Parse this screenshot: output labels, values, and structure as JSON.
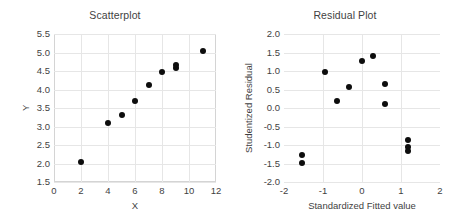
{
  "figure": {
    "background_color": "#ffffff",
    "grid_color": "#e6e6e6",
    "frame_color": "#d4d4d4",
    "marker_color": "#0d0d0d",
    "text_color": "#3f3f3f"
  },
  "chart_data": [
    {
      "type": "scatter",
      "title": "Scatterplot",
      "xlabel": "X",
      "ylabel": "Y",
      "xlim": [
        0,
        12
      ],
      "ylim": [
        1.5,
        5.5
      ],
      "xticks": [
        "0",
        "2",
        "4",
        "6",
        "8",
        "10",
        "12"
      ],
      "xtick_values": [
        0,
        2,
        4,
        6,
        8,
        10,
        12
      ],
      "yticks": [
        "1.5",
        "2.0",
        "2.5",
        "3.0",
        "3.5",
        "4.0",
        "4.5",
        "5.0",
        "5.5"
      ],
      "ytick_values": [
        1.5,
        2.0,
        2.5,
        3.0,
        3.5,
        4.0,
        4.5,
        5.0,
        5.5
      ],
      "grid": true,
      "legend": false,
      "points": [
        {
          "x": 2,
          "y": 2.05
        },
        {
          "x": 4,
          "y": 3.1
        },
        {
          "x": 5,
          "y": 3.3
        },
        {
          "x": 6,
          "y": 3.68
        },
        {
          "x": 7,
          "y": 4.13
        },
        {
          "x": 8,
          "y": 4.48
        },
        {
          "x": 9,
          "y": 4.58
        },
        {
          "x": 9,
          "y": 4.67
        },
        {
          "x": 11,
          "y": 5.05
        }
      ]
    },
    {
      "type": "scatter",
      "title": "Residual Plot",
      "xlabel": "Standardized Fitted value",
      "ylabel": "Studentized Residual",
      "xlim": [
        -2,
        2
      ],
      "ylim": [
        -2.0,
        2.0
      ],
      "xticks": [
        "-2",
        "-1",
        "0",
        "1",
        "2"
      ],
      "xtick_values": [
        -2,
        -1,
        0,
        1,
        2
      ],
      "yticks": [
        "-2.0",
        "-1.5",
        "-1.0",
        "-0.5",
        "0.0",
        "0.5",
        "1.0",
        "1.5",
        "2.0"
      ],
      "ytick_values": [
        -2.0,
        -1.5,
        -1.0,
        -0.5,
        0.0,
        0.5,
        1.0,
        1.5,
        2.0
      ],
      "grid": true,
      "legend": false,
      "points": [
        {
          "x": -1.55,
          "y": -1.28
        },
        {
          "x": -1.55,
          "y": -1.48
        },
        {
          "x": -0.95,
          "y": 0.97
        },
        {
          "x": -0.65,
          "y": 0.2
        },
        {
          "x": -0.33,
          "y": 0.58
        },
        {
          "x": 0.0,
          "y": 1.27
        },
        {
          "x": 0.27,
          "y": 1.41
        },
        {
          "x": 0.58,
          "y": 0.66
        },
        {
          "x": 0.58,
          "y": 0.1
        },
        {
          "x": 1.18,
          "y": -0.87
        },
        {
          "x": 1.18,
          "y": -1.05
        },
        {
          "x": 1.18,
          "y": -1.15
        }
      ]
    }
  ]
}
